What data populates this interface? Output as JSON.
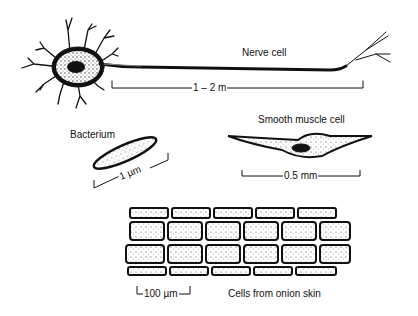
{
  "diagram": {
    "nerve_cell": {
      "label": "Nerve cell",
      "scale": "1 – 2 m"
    },
    "bacterium": {
      "label": "Bacterium",
      "scale": "1 µm"
    },
    "smooth_muscle_cell": {
      "label": "Smooth muscle cell",
      "scale": "0.5 mm"
    },
    "onion_skin_cells": {
      "label": "Cells from onion skin",
      "scale": "100 µm"
    }
  },
  "colors": {
    "ink": "#111111",
    "stipple": "#555555",
    "background": "#ffffff"
  }
}
